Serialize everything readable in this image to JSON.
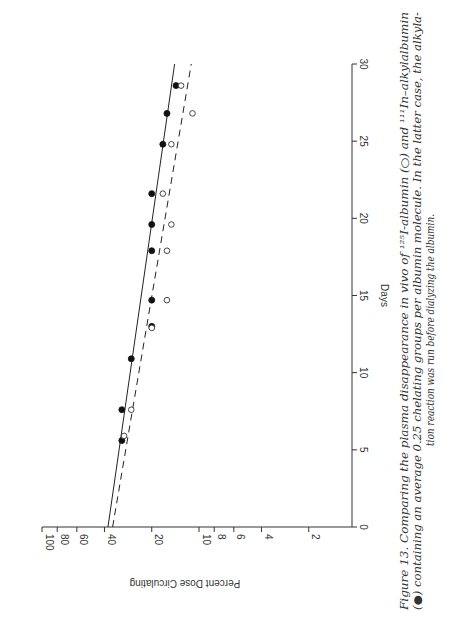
{
  "figure": {
    "orientation": "rotated 90 degrees clockwise (landscape figure on portrait page)",
    "caption_lines": [
      "Figure 13.   Comparing the plasma disappearance in vivo of ¹²⁵I-albumin (○) and ¹¹¹In–alkylalbumin",
      "(●) containing an average 0.25 chelating groups per albumin molecule. In the latter case, the alkyla-",
      "tion reaction was run before dialyzing the albumin."
    ]
  },
  "chart_data": {
    "type": "scatter",
    "title": "",
    "xlabel": "Days",
    "ylabel": "Percent  Dose Circulating",
    "xlim": [
      0,
      30
    ],
    "ylim": [
      1.5,
      100
    ],
    "yscale": "log",
    "x_ticks": [
      "0",
      "5",
      "10",
      "15",
      "20",
      "25",
      "30"
    ],
    "y_ticks": [
      "100",
      "80",
      "60",
      "40",
      "20",
      "10",
      "8",
      "6",
      "4",
      "2"
    ],
    "grid": false,
    "legend": "in caption",
    "series": [
      {
        "name": "111In-alkylalbumin (filled circles)",
        "marker": "filled-circle",
        "x": [
          5.6,
          7.6,
          10.9,
          13.0,
          14.7,
          17.9,
          19.6,
          21.6,
          24.8,
          26.8,
          28.6
        ],
        "y": [
          31,
          31,
          27,
          20,
          20,
          20,
          20,
          20,
          17,
          16,
          14
        ],
        "fit_line": {
          "style": "solid",
          "x": [
            0,
            30
          ],
          "y": [
            38,
            14.3
          ]
        }
      },
      {
        "name": "125I-albumin (open circles)",
        "marker": "open-circle",
        "x": [
          5.9,
          7.6,
          12.9,
          14.7,
          17.9,
          19.6,
          21.6,
          24.8,
          26.8,
          28.6
        ],
        "y": [
          30,
          27,
          20,
          16,
          16,
          15,
          17,
          15,
          11,
          13
        ],
        "fit_line": {
          "style": "dashed",
          "x": [
            0,
            30
          ],
          "y": [
            35.5,
            11.2
          ]
        }
      }
    ]
  }
}
